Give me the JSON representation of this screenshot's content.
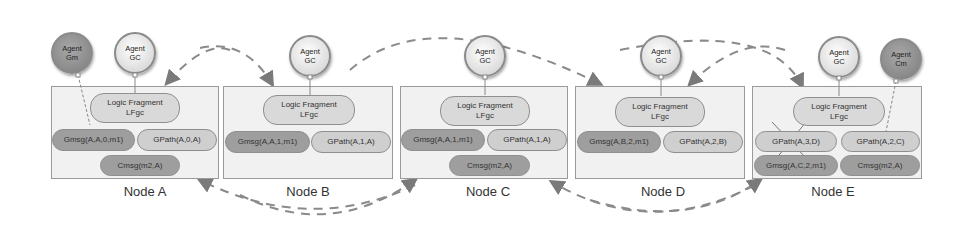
{
  "diagram": {
    "nodes": [
      {
        "id": "A",
        "label": "Node A",
        "logic_fragment": "Logic Fragment\nLFgc",
        "pills": [
          "Gmsg(A,A,0,m1)",
          "GPath(A,0,A)",
          "Cmsg(m2,A)"
        ]
      },
      {
        "id": "B",
        "label": "Node B",
        "logic_fragment": "Logic Fragment\nLFgc",
        "pills": [
          "Gmsg(A,A,1,m1)",
          "GPath(A,1,A)"
        ]
      },
      {
        "id": "C",
        "label": "Node C",
        "logic_fragment": "Logic Fragment\nLFgc",
        "pills": [
          "Gmsg(A,A,1,m1)",
          "GPath(A,1,A)",
          "Cmsg(m2,A)"
        ]
      },
      {
        "id": "D",
        "label": "Node D",
        "logic_fragment": "Logic Fragment\nLFgc",
        "pills": [
          "Gmsg(A,B,2,m1)",
          "GPath(A,2,B)"
        ]
      },
      {
        "id": "E",
        "label": "Node E",
        "logic_fragment": "Logic Fragment\nLFgc",
        "pills": [
          "GPath(A,3,D)",
          "GPath(A,2,C)",
          "Gmsg(A,C,2,m1)",
          "Cmsg(m2,A)"
        ]
      }
    ],
    "agents": [
      {
        "id": "gm",
        "line1": "Agent",
        "line2": "Gm",
        "node": "A"
      },
      {
        "id": "gc-a",
        "line1": "Agent",
        "line2": "GC",
        "node": "A"
      },
      {
        "id": "gc-b",
        "line1": "Agent",
        "line2": "GC",
        "node": "B"
      },
      {
        "id": "gc-c",
        "line1": "Agent",
        "line2": "GC",
        "node": "C"
      },
      {
        "id": "gc-d",
        "line1": "Agent",
        "line2": "GC",
        "node": "D"
      },
      {
        "id": "gc-e",
        "line1": "Agent",
        "line2": "GC",
        "node": "E"
      },
      {
        "id": "cm",
        "line1": "Agent",
        "line2": "Cm",
        "node": "E"
      }
    ],
    "edges": [
      {
        "from": "B",
        "to": "A",
        "style": "dashed-arrow",
        "position": "top"
      },
      {
        "from": "A",
        "to": "B",
        "style": "dashed-arrow",
        "position": "top"
      },
      {
        "from": "B",
        "to": "D",
        "style": "dashed-arrow",
        "position": "top"
      },
      {
        "from": "E",
        "to": "D",
        "style": "dashed-arrow",
        "position": "top"
      },
      {
        "from": "D",
        "to": "E",
        "style": "dashed-arrow",
        "position": "top"
      },
      {
        "from": "C",
        "to": "A",
        "style": "dashed-arrow",
        "position": "bottom"
      },
      {
        "from": "B",
        "to": "C",
        "style": "dashed-arrow",
        "position": "bottom"
      },
      {
        "from": "E",
        "to": "C",
        "style": "dashed-arrow",
        "position": "bottom"
      },
      {
        "from": "D",
        "to": "E",
        "style": "dashed-arrow",
        "position": "bottom"
      }
    ],
    "colors": {
      "node_fill": "#f1f1f1",
      "node_border": "#9a9a9a",
      "light_pill": "#cfcfcf",
      "dark_pill": "#9e9e9e",
      "arrow": "#7a7a7a"
    }
  }
}
